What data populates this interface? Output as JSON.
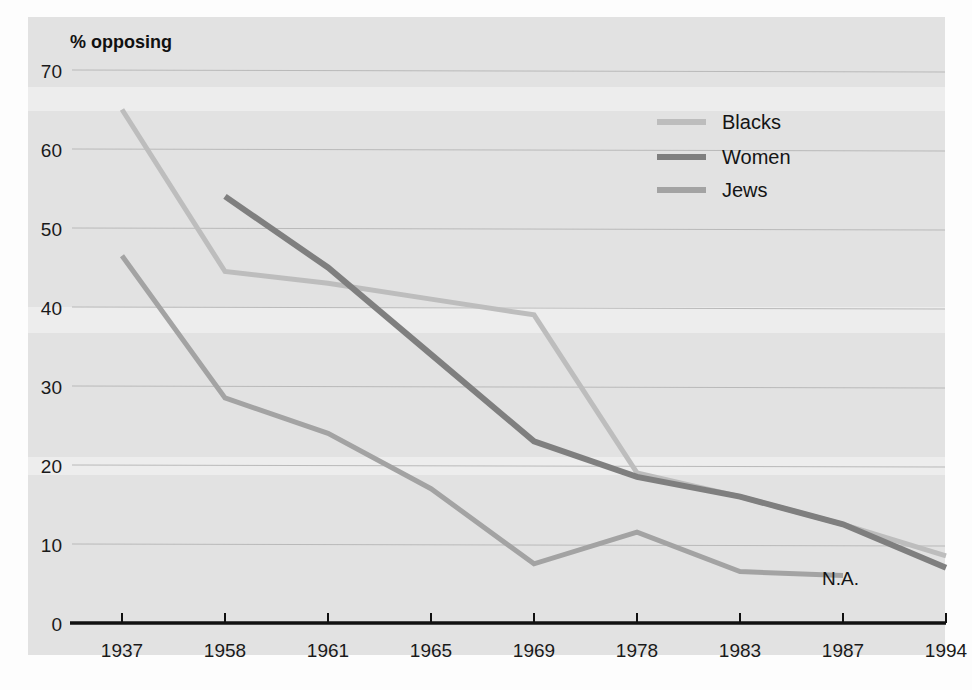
{
  "chart_data": {
    "type": "line",
    "title": "% opposing",
    "xlabel": "",
    "ylabel": "% opposing",
    "ylim": [
      0,
      70
    ],
    "ytick_step": 10,
    "grid": true,
    "legend_position": "top-right",
    "categories": [
      "1937",
      "1958",
      "1961",
      "1965",
      "1969",
      "1978",
      "1983",
      "1987",
      "1994"
    ],
    "yticks": [
      "0",
      "10",
      "20",
      "30",
      "40",
      "50",
      "60",
      "70"
    ],
    "series": [
      {
        "name": "Blacks",
        "color": "#bdbdbd",
        "values": [
          65,
          44.5,
          43,
          41,
          39,
          19,
          16,
          12.5,
          8.5
        ]
      },
      {
        "name": "Women",
        "color": "#7f7f7f",
        "values": [
          null,
          54,
          45,
          34,
          23,
          18.5,
          16,
          12.5,
          7
        ]
      },
      {
        "name": "Jews",
        "color": "#a3a3a3",
        "values": [
          46.5,
          28.5,
          24,
          17,
          7.5,
          11.5,
          6.5,
          6,
          null
        ]
      }
    ],
    "annotations": [
      {
        "text": "N.A.",
        "x_category": "1987",
        "note": "not available after 1987 for Jews"
      }
    ]
  },
  "axis": {
    "y_title": "% opposing"
  },
  "legend": {
    "items": [
      {
        "label": "Blacks",
        "swatch": "legend-swatch-blacks"
      },
      {
        "label": "Women",
        "swatch": "legend-swatch-women"
      },
      {
        "label": "Jews",
        "swatch": "legend-swatch-jews"
      }
    ]
  },
  "colors": {
    "panel_background": "#e2e2e2",
    "axis": "#101010",
    "gridline": "#b9b9b9",
    "blacks": "#bdbdbd",
    "women": "#7f7f7f",
    "jews": "#a3a3a3",
    "text": "#141414"
  }
}
